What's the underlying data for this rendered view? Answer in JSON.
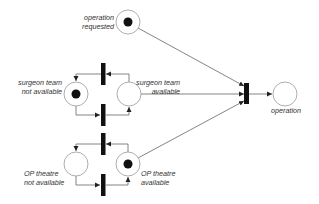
{
  "diagram": {
    "type": "petri-net",
    "colors": {
      "place_stroke": "#999999",
      "arc": "#666666",
      "transition": "#111111",
      "token": "#111111",
      "label": "#333333"
    },
    "places": [
      {
        "id": "operation_requested",
        "label_line1": "operation",
        "label_line2": "requested",
        "tokens": 1
      },
      {
        "id": "surgeon_not_available",
        "label_line1": "surgeon team",
        "label_line2": "not available",
        "tokens": 1
      },
      {
        "id": "surgeon_available",
        "label_line1": "surgeon team",
        "label_line2": "available",
        "tokens": 0
      },
      {
        "id": "op_not_available",
        "label_line1": "OP theatre",
        "label_line2": "not available",
        "tokens": 0
      },
      {
        "id": "op_available",
        "label_line1": "OP theatre",
        "label_line2": "available",
        "tokens": 1
      },
      {
        "id": "operation",
        "label_line1": "operation",
        "label_line2": "",
        "tokens": 0
      }
    ],
    "transitions": [
      {
        "id": "surgeon_release"
      },
      {
        "id": "surgeon_occupy"
      },
      {
        "id": "op_release"
      },
      {
        "id": "op_occupy"
      },
      {
        "id": "start_operation"
      }
    ]
  }
}
